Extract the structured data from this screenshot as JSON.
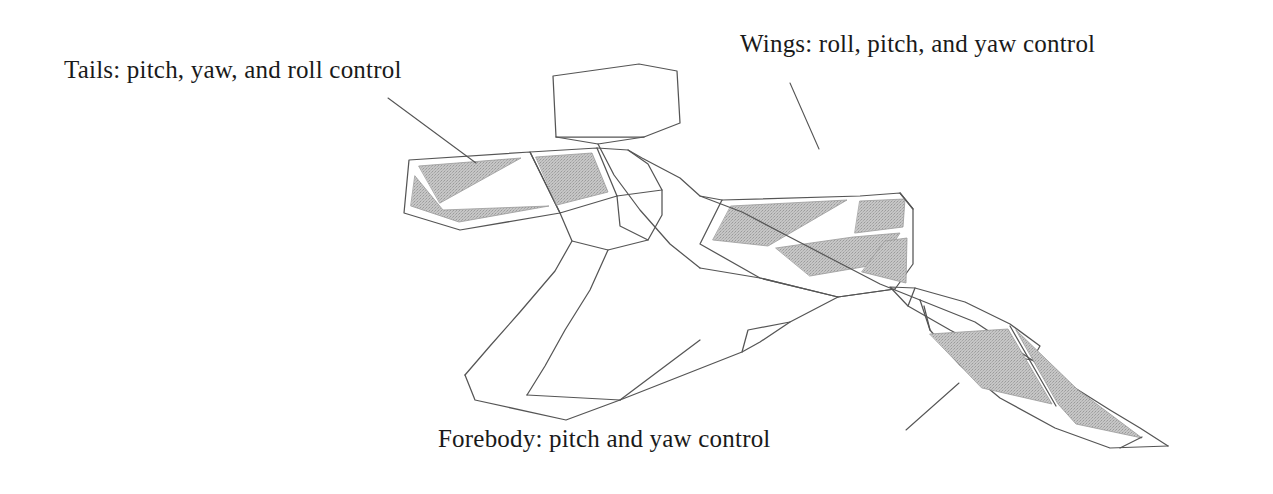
{
  "figure": {
    "kind": "aircraft-control-surface-diagram",
    "background_color": "#ffffff",
    "line_color": "#4a4a4a",
    "shading_color": "#bcbcbc",
    "text_color": "#1a1a1a"
  },
  "labels": {
    "tails": "Tails: pitch, yaw, and roll control",
    "wings": "Wings: roll, pitch, and yaw control",
    "forebody": "Forebody: pitch and yaw control"
  },
  "leader_lines": {
    "tails": {
      "from_x": 388,
      "from_y": 98,
      "to_x": 476,
      "to_y": 163
    },
    "wings": {
      "from_x": 790,
      "from_y": 83,
      "to_x": 819,
      "to_y": 149
    },
    "forebody": {
      "from_x": 906,
      "from_y": 430,
      "to_x": 959,
      "to_y": 383
    }
  },
  "control_surfaces": {
    "tail_count": 3,
    "wing_count": 4,
    "forebody_count": 2
  }
}
